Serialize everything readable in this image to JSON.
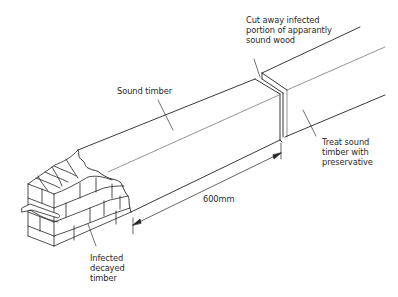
{
  "diagram": {
    "type": "technical-illustration"
  },
  "labels": {
    "cut_away": "Cut away infected\nportion of apparantly\nsound wood",
    "sound_timber": "Sound timber",
    "treat": "Treat sound\ntimber with\npreservative",
    "dimension": "600mm",
    "infected": "Infected\ndecayed\ntimber"
  },
  "colors": {
    "line": "#222222",
    "thin_line": "#555555",
    "background": "#ffffff"
  }
}
